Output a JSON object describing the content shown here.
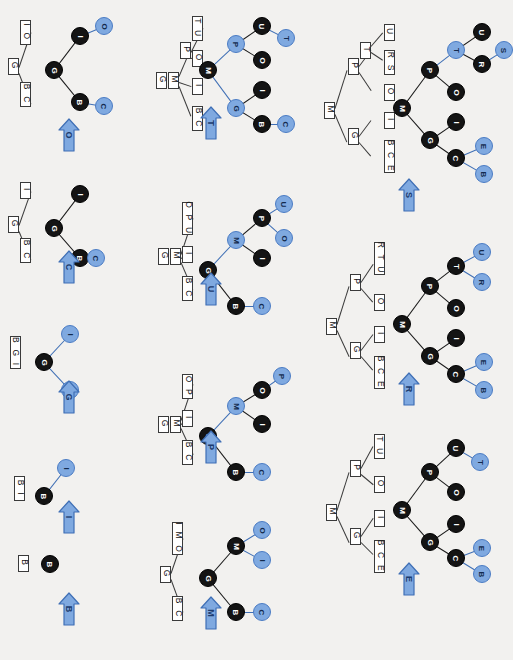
{
  "diagram": {
    "orientation": "rotated-90",
    "colors": {
      "node_black": "#141414",
      "node_blue": "#7fa9e0",
      "edge_black": "#1a1a1a",
      "edge_blue": "#3f6fb5",
      "arrow_fill": "#7fa9e0",
      "arrow_stroke": "#3f6fb5",
      "box_border": "#3a3a3a",
      "background": "#f2f1ef"
    }
  },
  "steps": [
    {
      "id": "step-1",
      "arrow_label": "B",
      "legend": {
        "boxes": [
          "B"
        ]
      },
      "nodes": [
        {
          "label": "B",
          "color": "black"
        }
      ],
      "edges": []
    },
    {
      "id": "step-2",
      "arrow_label": "I",
      "legend": {
        "boxes": [
          "B",
          "I"
        ]
      },
      "nodes": [
        {
          "label": "B",
          "color": "black"
        },
        {
          "label": "I",
          "color": "blue"
        }
      ],
      "edges": [
        {
          "from": "B",
          "to": "I",
          "color": "blue"
        }
      ]
    },
    {
      "id": "step-3",
      "arrow_label": "G",
      "legend": {
        "boxes": [
          "B",
          "G",
          "I"
        ]
      },
      "nodes": [
        {
          "label": "G",
          "color": "black"
        },
        {
          "label": "I",
          "color": "blue"
        },
        {
          "label": "B",
          "color": "blue"
        }
      ],
      "edges": [
        {
          "from": "G",
          "to": "I",
          "color": "blue"
        },
        {
          "from": "G",
          "to": "B",
          "color": "blue"
        }
      ]
    },
    {
      "id": "step-4",
      "arrow_label": "C",
      "legend": {
        "root": "G",
        "children": [
          "I",
          "BC"
        ]
      },
      "nodes": [
        {
          "label": "G",
          "color": "black"
        },
        {
          "label": "I",
          "color": "black"
        },
        {
          "label": "B",
          "color": "black"
        },
        {
          "label": "C",
          "color": "blue"
        }
      ],
      "edges": [
        {
          "from": "G",
          "to": "I",
          "color": "black"
        },
        {
          "from": "G",
          "to": "B",
          "color": "black"
        },
        {
          "from": "B",
          "to": "C",
          "color": "blue"
        }
      ]
    },
    {
      "id": "step-5",
      "arrow_label": "O",
      "legend": {
        "root": "G",
        "children": [
          "IO",
          "BC"
        ]
      },
      "nodes": [
        {
          "label": "G",
          "color": "black"
        },
        {
          "label": "I",
          "color": "black"
        },
        {
          "label": "O",
          "color": "blue"
        },
        {
          "label": "B",
          "color": "black"
        },
        {
          "label": "C",
          "color": "blue"
        }
      ],
      "edges": [
        {
          "from": "G",
          "to": "I",
          "color": "black"
        },
        {
          "from": "I",
          "to": "O",
          "color": "blue"
        },
        {
          "from": "G",
          "to": "B",
          "color": "black"
        },
        {
          "from": "B",
          "to": "C",
          "color": "blue"
        }
      ]
    },
    {
      "id": "step-6",
      "arrow_label": "M",
      "legend": {
        "root": "G",
        "children": [
          "IMO",
          "BC"
        ]
      },
      "nodes": [
        {
          "label": "G",
          "color": "black"
        },
        {
          "label": "M",
          "color": "black"
        },
        {
          "label": "O",
          "color": "blue"
        },
        {
          "label": "I",
          "color": "blue"
        },
        {
          "label": "B",
          "color": "black"
        },
        {
          "label": "C",
          "color": "blue"
        }
      ],
      "edges": [
        {
          "from": "G",
          "to": "M",
          "color": "black"
        },
        {
          "from": "M",
          "to": "O",
          "color": "blue"
        },
        {
          "from": "M",
          "to": "I",
          "color": "blue"
        },
        {
          "from": "G",
          "to": "B",
          "color": "black"
        },
        {
          "from": "B",
          "to": "C",
          "color": "blue"
        }
      ]
    },
    {
      "id": "step-7",
      "arrow_label": "P",
      "legend": {
        "root": "G M",
        "children": [
          "OP",
          "I",
          "BC"
        ]
      },
      "nodes": [
        {
          "label": "G",
          "color": "black"
        },
        {
          "label": "M",
          "color": "blue"
        },
        {
          "label": "O",
          "color": "black"
        },
        {
          "label": "P",
          "color": "blue"
        },
        {
          "label": "I",
          "color": "black"
        },
        {
          "label": "B",
          "color": "black"
        },
        {
          "label": "C",
          "color": "blue"
        }
      ],
      "edges": [
        {
          "from": "G",
          "to": "M",
          "color": "blue"
        },
        {
          "from": "M",
          "to": "O",
          "color": "black"
        },
        {
          "from": "O",
          "to": "P",
          "color": "blue"
        },
        {
          "from": "M",
          "to": "I",
          "color": "black"
        },
        {
          "from": "G",
          "to": "B",
          "color": "black"
        },
        {
          "from": "B",
          "to": "C",
          "color": "blue"
        }
      ]
    },
    {
      "id": "step-8",
      "arrow_label": "U",
      "legend": {
        "root": "G M",
        "children": [
          "OPU",
          "I",
          "BC"
        ]
      },
      "nodes": [
        {
          "label": "G",
          "color": "black"
        },
        {
          "label": "M",
          "color": "blue"
        },
        {
          "label": "P",
          "color": "black"
        },
        {
          "label": "U",
          "color": "blue"
        },
        {
          "label": "O",
          "color": "blue"
        },
        {
          "label": "I",
          "color": "black"
        },
        {
          "label": "B",
          "color": "black"
        },
        {
          "label": "C",
          "color": "blue"
        }
      ],
      "edges": [
        {
          "from": "G",
          "to": "M",
          "color": "blue"
        },
        {
          "from": "M",
          "to": "P",
          "color": "black"
        },
        {
          "from": "P",
          "to": "U",
          "color": "blue"
        },
        {
          "from": "P",
          "to": "O",
          "color": "blue"
        },
        {
          "from": "M",
          "to": "I",
          "color": "black"
        },
        {
          "from": "G",
          "to": "B",
          "color": "black"
        },
        {
          "from": "B",
          "to": "C",
          "color": "blue"
        }
      ]
    },
    {
      "id": "step-9",
      "arrow_label": "T",
      "legend": {
        "root": "G M P",
        "children": [
          "TU",
          "O",
          "I",
          "BC"
        ]
      },
      "nodes": [
        {
          "label": "M",
          "color": "black"
        },
        {
          "label": "P",
          "color": "blue"
        },
        {
          "label": "U",
          "color": "black"
        },
        {
          "label": "T",
          "color": "blue"
        },
        {
          "label": "O",
          "color": "black"
        },
        {
          "label": "G",
          "color": "blue"
        },
        {
          "label": "I",
          "color": "black"
        },
        {
          "label": "B",
          "color": "black"
        },
        {
          "label": "C",
          "color": "blue"
        }
      ],
      "edges": [
        {
          "from": "M",
          "to": "P",
          "color": "blue"
        },
        {
          "from": "P",
          "to": "U",
          "color": "black"
        },
        {
          "from": "U",
          "to": "T",
          "color": "blue"
        },
        {
          "from": "P",
          "to": "O",
          "color": "black"
        },
        {
          "from": "M",
          "to": "G",
          "color": "blue"
        },
        {
          "from": "G",
          "to": "I",
          "color": "black"
        },
        {
          "from": "G",
          "to": "B",
          "color": "black"
        },
        {
          "from": "B",
          "to": "C",
          "color": "blue"
        }
      ]
    },
    {
      "id": "step-10",
      "arrow_label": "E",
      "legend": {
        "root": "M",
        "mid": [
          "P",
          "G"
        ],
        "leaves_p": [
          "TU",
          "O"
        ],
        "leaves_g": [
          "I",
          "BCE"
        ]
      },
      "nodes": [
        {
          "label": "M",
          "color": "black"
        },
        {
          "label": "P",
          "color": "black"
        },
        {
          "label": "U",
          "color": "black"
        },
        {
          "label": "T",
          "color": "blue"
        },
        {
          "label": "O",
          "color": "black"
        },
        {
          "label": "G",
          "color": "black"
        },
        {
          "label": "I",
          "color": "black"
        },
        {
          "label": "C",
          "color": "black"
        },
        {
          "label": "E",
          "color": "blue"
        },
        {
          "label": "B",
          "color": "blue"
        }
      ],
      "edges": [
        {
          "from": "M",
          "to": "P",
          "color": "black"
        },
        {
          "from": "P",
          "to": "U",
          "color": "black"
        },
        {
          "from": "U",
          "to": "T",
          "color": "blue"
        },
        {
          "from": "P",
          "to": "O",
          "color": "black"
        },
        {
          "from": "M",
          "to": "G",
          "color": "black"
        },
        {
          "from": "G",
          "to": "I",
          "color": "black"
        },
        {
          "from": "G",
          "to": "C",
          "color": "black"
        },
        {
          "from": "C",
          "to": "E",
          "color": "blue"
        },
        {
          "from": "C",
          "to": "B",
          "color": "blue"
        }
      ]
    },
    {
      "id": "step-11",
      "arrow_label": "R",
      "legend": {
        "root": "M",
        "mid": [
          "P",
          "G"
        ],
        "leaves_p": [
          "RTU",
          "O"
        ],
        "leaves_g": [
          "I",
          "BCE"
        ]
      },
      "nodes": [
        {
          "label": "M",
          "color": "black"
        },
        {
          "label": "P",
          "color": "black"
        },
        {
          "label": "T",
          "color": "black"
        },
        {
          "label": "U",
          "color": "blue"
        },
        {
          "label": "R",
          "color": "blue"
        },
        {
          "label": "O",
          "color": "black"
        },
        {
          "label": "G",
          "color": "black"
        },
        {
          "label": "I",
          "color": "black"
        },
        {
          "label": "C",
          "color": "black"
        },
        {
          "label": "E",
          "color": "blue"
        },
        {
          "label": "B",
          "color": "blue"
        }
      ],
      "edges": [
        {
          "from": "M",
          "to": "P",
          "color": "black"
        },
        {
          "from": "P",
          "to": "T",
          "color": "black"
        },
        {
          "from": "T",
          "to": "U",
          "color": "blue"
        },
        {
          "from": "T",
          "to": "R",
          "color": "blue"
        },
        {
          "from": "P",
          "to": "O",
          "color": "black"
        },
        {
          "from": "M",
          "to": "G",
          "color": "black"
        },
        {
          "from": "G",
          "to": "I",
          "color": "black"
        },
        {
          "from": "G",
          "to": "C",
          "color": "black"
        },
        {
          "from": "C",
          "to": "E",
          "color": "blue"
        },
        {
          "from": "C",
          "to": "B",
          "color": "blue"
        }
      ]
    },
    {
      "id": "step-12",
      "arrow_label": "S",
      "legend": {
        "root": "M",
        "mid": [
          "P T",
          "G"
        ],
        "leaves_p": [
          "U",
          "RS",
          "O"
        ],
        "leaves_g": [
          "I",
          "BCE"
        ]
      },
      "nodes": [
        {
          "label": "M",
          "color": "black"
        },
        {
          "label": "P",
          "color": "black"
        },
        {
          "label": "T",
          "color": "blue"
        },
        {
          "label": "U",
          "color": "black"
        },
        {
          "label": "R",
          "color": "black"
        },
        {
          "label": "S",
          "color": "blue"
        },
        {
          "label": "O",
          "color": "black"
        },
        {
          "label": "G",
          "color": "black"
        },
        {
          "label": "I",
          "color": "black"
        },
        {
          "label": "C",
          "color": "black"
        },
        {
          "label": "E",
          "color": "blue"
        },
        {
          "label": "B",
          "color": "blue"
        }
      ],
      "edges": [
        {
          "from": "M",
          "to": "P",
          "color": "black"
        },
        {
          "from": "P",
          "to": "T",
          "color": "blue"
        },
        {
          "from": "T",
          "to": "U",
          "color": "black"
        },
        {
          "from": "T",
          "to": "R",
          "color": "black"
        },
        {
          "from": "R",
          "to": "S",
          "color": "blue"
        },
        {
          "from": "P",
          "to": "O",
          "color": "black"
        },
        {
          "from": "M",
          "to": "G",
          "color": "black"
        },
        {
          "from": "G",
          "to": "I",
          "color": "black"
        },
        {
          "from": "G",
          "to": "C",
          "color": "black"
        },
        {
          "from": "C",
          "to": "E",
          "color": "blue"
        },
        {
          "from": "C",
          "to": "B",
          "color": "blue"
        }
      ]
    }
  ]
}
